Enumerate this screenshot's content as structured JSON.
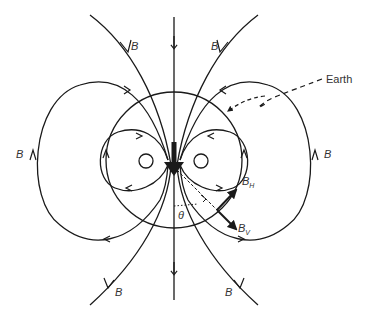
{
  "labels": {
    "field": "B",
    "earth": "Earth",
    "horizontal_component": "B",
    "horizontal_sub": "H",
    "vertical_component": "B",
    "vertical_sub": "V",
    "angle": "θ"
  },
  "colors": {
    "line": "#1a1a1a",
    "background": "#ffffff"
  }
}
